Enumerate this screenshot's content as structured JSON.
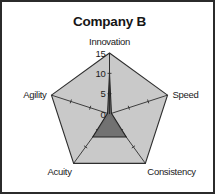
{
  "frame": {
    "border_color": "#2b2b2b",
    "background": "#ffffff"
  },
  "chart_data": {
    "type": "radar",
    "title": "Company B",
    "categories": [
      "Innovation",
      "Speed",
      "Consistency",
      "Acuity",
      "Agility"
    ],
    "series": [
      {
        "name": "Company B",
        "values": [
          10,
          0.5,
          7,
          7,
          0.5
        ],
        "fill_color": "#6e6e6e",
        "line_color": "#242424"
      }
    ],
    "grid": {
      "outer_value": 15,
      "fill_color": "#c9c9c9",
      "line_color": "#2e2e2e",
      "shape": "pentagon"
    },
    "axis": {
      "min": 0,
      "max": 15,
      "ticks": [
        0,
        5,
        10,
        15
      ],
      "tick_labels": [
        "0",
        "5",
        "10",
        "15"
      ],
      "tick_label_axis": "Innovation"
    },
    "xlabel": "",
    "ylabel": "",
    "legend": null
  },
  "labels": {
    "innovation": "Innovation",
    "speed": "Speed",
    "consistency": "Consistency",
    "acuity": "Acuity",
    "agility": "Agility",
    "tick_15": "15",
    "tick_10": "10",
    "tick_5": "5",
    "tick_0": "0"
  }
}
